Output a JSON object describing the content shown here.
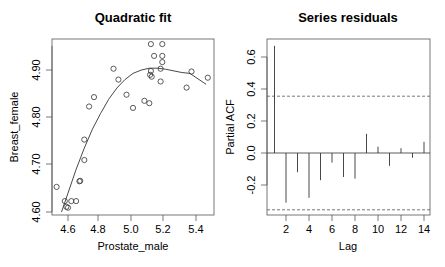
{
  "chart_data": [
    {
      "type": "scatter",
      "title": "Quadratic fit",
      "xlabel": "Prostate_male",
      "ylabel": "Breast_female",
      "xlim": [
        4.5,
        5.5
      ],
      "ylim": [
        4.6,
        4.96
      ],
      "xticks": [
        "4.6",
        "4.8",
        "5.0",
        "5.2",
        "5.4"
      ],
      "yticks": [
        "4.60",
        "4.70",
        "4.80",
        "4.90"
      ],
      "grid": false,
      "series": [
        {
          "name": "observations",
          "marker": "open-circle",
          "points": [
            [
              4.53,
              4.653
            ],
            [
              4.58,
              4.623
            ],
            [
              4.59,
              4.611
            ],
            [
              4.6,
              4.609
            ],
            [
              4.62,
              4.623
            ],
            [
              4.65,
              4.623
            ],
            [
              4.67,
              4.665
            ],
            [
              4.675,
              4.666
            ],
            [
              4.7,
              4.753
            ],
            [
              4.7,
              4.71
            ],
            [
              4.73,
              4.823
            ],
            [
              4.76,
              4.843
            ],
            [
              4.88,
              4.903
            ],
            [
              4.91,
              4.88
            ],
            [
              4.96,
              4.848
            ],
            [
              5.0,
              4.82
            ],
            [
              5.07,
              4.835
            ],
            [
              5.1,
              4.83
            ],
            [
              5.11,
              4.898
            ],
            [
              5.105,
              4.89
            ],
            [
              5.115,
              4.886
            ],
            [
              5.11,
              4.955
            ],
            [
              5.18,
              4.955
            ],
            [
              5.13,
              4.93
            ],
            [
              5.18,
              4.93
            ],
            [
              5.18,
              4.917
            ],
            [
              5.17,
              4.903
            ],
            [
              5.17,
              4.876
            ],
            [
              5.33,
              4.863
            ],
            [
              5.36,
              4.897
            ],
            [
              5.46,
              4.884
            ]
          ]
        },
        {
          "name": "quadratic fit",
          "type": "line",
          "points": [
            [
              4.56,
              4.6
            ],
            [
              4.6,
              4.64
            ],
            [
              4.65,
              4.69
            ],
            [
              4.7,
              4.735
            ],
            [
              4.75,
              4.775
            ],
            [
              4.8,
              4.808
            ],
            [
              4.85,
              4.838
            ],
            [
              4.9,
              4.862
            ],
            [
              4.95,
              4.88
            ],
            [
              5.0,
              4.893
            ],
            [
              5.05,
              4.9
            ],
            [
              5.1,
              4.904
            ],
            [
              5.15,
              4.904
            ],
            [
              5.2,
              4.902
            ],
            [
              5.3,
              4.895
            ],
            [
              5.35,
              4.893
            ],
            [
              5.45,
              4.87
            ]
          ]
        }
      ]
    },
    {
      "type": "bar",
      "subtype": "pacf",
      "title": "Series  residuals",
      "xlabel": "Lag",
      "ylabel": "Partial ACF",
      "xlim": [
        0.8,
        14.4
      ],
      "ylim": [
        -0.38,
        0.7
      ],
      "xticks": [
        "2",
        "4",
        "6",
        "8",
        "10",
        "12",
        "14"
      ],
      "yticks": [
        "-0.2",
        "0.0",
        "0.2",
        "0.4",
        "0.6"
      ],
      "categories": [
        1,
        2,
        3,
        4,
        5,
        6,
        7,
        8,
        9,
        10,
        11,
        12,
        13,
        14
      ],
      "values": [
        0.67,
        -0.31,
        -0.12,
        -0.28,
        -0.17,
        -0.06,
        -0.15,
        -0.16,
        0.12,
        0.04,
        -0.08,
        0.03,
        -0.03,
        0.07
      ],
      "confidence_bounds": [
        0.355,
        -0.355
      ],
      "grid": false
    }
  ],
  "footer_text": ""
}
